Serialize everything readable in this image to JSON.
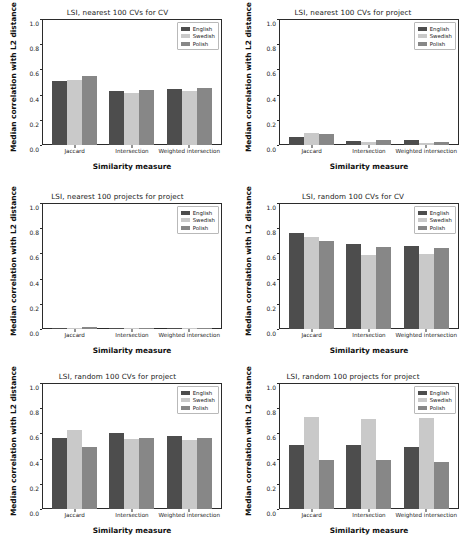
{
  "figure": {
    "rows": 3,
    "cols": 2,
    "background": "#ffffff"
  },
  "series_colors": {
    "English": "#4d4d4d",
    "Swedish": "#c9c9c9",
    "Polish": "#878787"
  },
  "common": {
    "xlabel": "Similarity measure",
    "ylabel": "Median correlation with L2 distance",
    "categories": [
      "Jaccard",
      "Intersection",
      "Weighted intersection"
    ],
    "yticks": [
      "1.0",
      "0.8",
      "0.6",
      "0.4",
      "0.2",
      "0.0"
    ],
    "ylim": [
      0.0,
      1.0
    ],
    "legend": [
      "English",
      "Swedish",
      "Polish"
    ]
  },
  "chart_data": [
    {
      "type": "bar",
      "title": "LSI, nearest 100 CVs for CV",
      "xlabel": "Similarity measure",
      "ylabel": "Median correlation with L2 distance",
      "categories": [
        "Jaccard",
        "Intersection",
        "Weighted intersection"
      ],
      "ylim": [
        0.0,
        1.0
      ],
      "grid": false,
      "legend_position": "upper right",
      "series": [
        {
          "name": "English",
          "values": [
            0.505,
            0.432,
            0.441
          ]
        },
        {
          "name": "Swedish",
          "values": [
            0.518,
            0.412,
            0.427
          ]
        },
        {
          "name": "Polish",
          "values": [
            0.546,
            0.437,
            0.449
          ]
        }
      ]
    },
    {
      "type": "bar",
      "title": "LSI, nearest 100 CVs for project",
      "xlabel": "Similarity measure",
      "ylabel": "Median correlation with L2 distance",
      "categories": [
        "Jaccard",
        "Intersection",
        "Weighted intersection"
      ],
      "ylim": [
        0.0,
        1.0
      ],
      "grid": false,
      "legend_position": "upper right",
      "series": [
        {
          "name": "English",
          "values": [
            0.066,
            0.035,
            0.039
          ]
        },
        {
          "name": "Swedish",
          "values": [
            0.096,
            0.024,
            0.013
          ]
        },
        {
          "name": "Polish",
          "values": [
            0.085,
            0.038,
            0.022
          ]
        }
      ]
    },
    {
      "type": "bar",
      "title": "LSI, nearest 100 projects for project",
      "xlabel": "Similarity measure",
      "ylabel": "Median correlation with L2 distance",
      "categories": [
        "Jaccard",
        "Intersection",
        "Weighted intersection"
      ],
      "ylim": [
        0.0,
        1.0
      ],
      "grid": false,
      "legend_position": "upper right",
      "series": [
        {
          "name": "English",
          "values": [
            0.004,
            0.01,
            0.002
          ]
        },
        {
          "name": "Swedish",
          "values": [
            0.006,
            0.003,
            0.004
          ]
        },
        {
          "name": "Polish",
          "values": [
            0.013,
            0.008,
            0.004
          ]
        }
      ]
    },
    {
      "type": "bar",
      "title": "LSI, random 100 CVs for CV",
      "xlabel": "Similarity measure",
      "ylabel": "Median correlation with L2 distance",
      "categories": [
        "Jaccard",
        "Intersection",
        "Weighted intersection"
      ],
      "ylim": [
        0.0,
        1.0
      ],
      "grid": false,
      "legend_position": "upper right",
      "series": [
        {
          "name": "English",
          "values": [
            0.762,
            0.672,
            0.661
          ]
        },
        {
          "name": "Swedish",
          "values": [
            0.727,
            0.588,
            0.596
          ]
        },
        {
          "name": "Polish",
          "values": [
            0.701,
            0.653,
            0.643
          ]
        }
      ]
    },
    {
      "type": "bar",
      "title": "LSI, random 100 CVs for project",
      "xlabel": "Similarity measure",
      "ylabel": "Median correlation with L2 distance",
      "categories": [
        "Jaccard",
        "Intersection",
        "Weighted intersection"
      ],
      "ylim": [
        0.0,
        1.0
      ],
      "grid": false,
      "legend_position": "upper right",
      "series": [
        {
          "name": "English",
          "values": [
            0.56,
            0.6,
            0.576
          ]
        },
        {
          "name": "Swedish",
          "values": [
            0.629,
            0.559,
            0.551
          ]
        },
        {
          "name": "Polish",
          "values": [
            0.489,
            0.563,
            0.565
          ]
        }
      ]
    },
    {
      "type": "bar",
      "title": "LSI, random 100 projects for project",
      "xlabel": "Similarity measure",
      "ylabel": "Median correlation with L2 distance",
      "categories": [
        "Jaccard",
        "Intersection",
        "Weighted intersection"
      ],
      "ylim": [
        0.0,
        1.0
      ],
      "grid": false,
      "legend_position": "upper right",
      "series": [
        {
          "name": "English",
          "values": [
            0.512,
            0.512,
            0.494
          ]
        },
        {
          "name": "Swedish",
          "values": [
            0.734,
            0.718,
            0.722
          ]
        },
        {
          "name": "Polish",
          "values": [
            0.387,
            0.389,
            0.374
          ]
        }
      ]
    }
  ]
}
